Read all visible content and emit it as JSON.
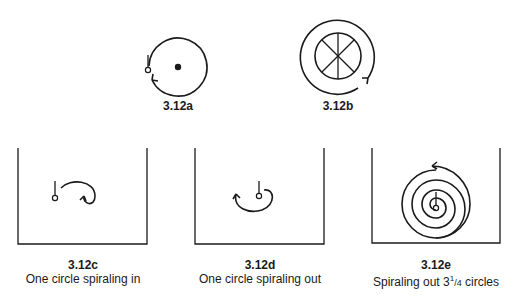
{
  "figures": [
    {
      "id": "3.12a",
      "label": "3.12a",
      "caption": ""
    },
    {
      "id": "3.12b",
      "label": "3.12b",
      "caption": ""
    },
    {
      "id": "3.12c",
      "label": "3.12c",
      "caption": "One circle spiraling in"
    },
    {
      "id": "3.12d",
      "label": "3.12d",
      "caption": "One circle spiraling out"
    },
    {
      "id": "3.12e",
      "label": "3.12e",
      "caption_prefix": "Spiraling out 3",
      "caption_frac_num": "1",
      "caption_frac_den": "/4",
      "caption_suffix": " circles"
    }
  ],
  "colors": {
    "stroke": "#1a1a1a",
    "background": "#ffffff"
  }
}
